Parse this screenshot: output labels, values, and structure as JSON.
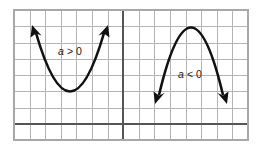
{
  "figure": {
    "background_color": "#ffffff",
    "grid": {
      "line_color": "#b4b4b4",
      "axis_color": "#555555",
      "border_color": "#a8a8a8",
      "left": 14,
      "top": 10,
      "right": 248,
      "bottom": 140,
      "columns": 15,
      "rows": 8,
      "cell_width": 15.6,
      "cell_height": 16.25,
      "x_axis_y": 124,
      "y_axis_x": 123
    },
    "curves": [
      {
        "id": "left-parabola",
        "orientation": "opens-up",
        "label": "a > 0",
        "label_variable": "a",
        "label_operator": ">",
        "label_value": "0",
        "label_x": 70,
        "label_y": 52,
        "color": "#111111",
        "vertex_x": 70,
        "vertex_y": 104,
        "left_end_x": 32,
        "left_end_y": 27,
        "right_end_x": 108,
        "right_end_y": 27
      },
      {
        "id": "right-parabola",
        "orientation": "opens-down",
        "label": "a < 0",
        "label_variable": "a",
        "label_operator": "<",
        "label_value": "0",
        "label_x": 190,
        "label_y": 75,
        "color": "#111111",
        "vertex_x": 191,
        "vertex_y": 28,
        "left_end_x": 156,
        "left_end_y": 101,
        "right_end_x": 226,
        "right_end_y": 101
      }
    ]
  }
}
